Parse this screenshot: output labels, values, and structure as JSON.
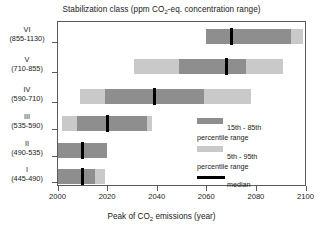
{
  "chart_data": {
    "type": "bar",
    "subtype": "horizontal-range-bar",
    "title": "Stabilization class (ppm CO2-eq. concentration range)",
    "title_parts": {
      "pre": "Stabilization class (ppm CO",
      "sub": "2",
      "post": "-eq. concentration range)"
    },
    "xlabel": "Peak of CO2 emissions (year)",
    "xlabel_parts": {
      "pre": "Peak of CO",
      "sub": "2",
      "post": " emissions (year)"
    },
    "ylabel": "",
    "xlim": [
      2000,
      2100
    ],
    "xticks": [
      2000,
      2020,
      2040,
      2060,
      2080,
      2100
    ],
    "xtick_labels": [
      "2000",
      "2020",
      "2040",
      "2060",
      "2080",
      "2100"
    ],
    "grid": false,
    "legend_position": "inside-right-middle",
    "categories": [
      "I",
      "II",
      "III",
      "IV",
      "V",
      "VI"
    ],
    "category_ranges": [
      "(445-490)",
      "(490-535)",
      "(535-590)",
      "(590-710)",
      "(710-855)",
      "(855-1130)"
    ],
    "series": [
      {
        "name": "5th - 95th percentile range",
        "color": "#c9c9c9",
        "values": [
          [
            2000,
            2019
          ],
          [
            2000,
            2020
          ],
          [
            2002,
            2038
          ],
          [
            2009,
            2078
          ],
          [
            2031,
            2091
          ],
          [
            2060,
            2099
          ]
        ]
      },
      {
        "name": "15th - 85th percentile range",
        "color": "#8e8e8e",
        "values": [
          [
            2000,
            2015
          ],
          [
            2000,
            2020
          ],
          [
            2008,
            2036
          ],
          [
            2019,
            2059
          ],
          [
            2049,
            2076
          ],
          [
            2060,
            2094
          ]
        ]
      },
      {
        "name": "median",
        "color": "#000000",
        "values": [
          2010,
          2010,
          2020,
          2039,
          2068,
          2070
        ]
      }
    ],
    "rows": [
      {
        "roman": "VI",
        "range": "(855-1130)",
        "p05": 2060,
        "p95": 2099,
        "p15": 2060,
        "p85": 2094,
        "median": 2070
      },
      {
        "roman": "V",
        "range": "(710-855)",
        "p05": 2031,
        "p95": 2091,
        "p15": 2049,
        "p85": 2076,
        "median": 2068
      },
      {
        "roman": "IV",
        "range": "(590-710)",
        "p05": 2009,
        "p95": 2078,
        "p15": 2019,
        "p85": 2059,
        "median": 2039
      },
      {
        "roman": "III",
        "range": "(535-590)",
        "p05": 2002,
        "p95": 2038,
        "p15": 2008,
        "p85": 2036,
        "median": 2020
      },
      {
        "roman": "II",
        "range": "(490-535)",
        "p05": 2000,
        "p95": 2020,
        "p15": 2000,
        "p85": 2020,
        "median": 2010
      },
      {
        "roman": "I",
        "range": "(445-490)",
        "p05": 2000,
        "p95": 2019,
        "p15": 2000,
        "p85": 2015,
        "median": 2010
      }
    ]
  },
  "legend": {
    "items": [
      {
        "label_line1": "15th - 85th",
        "label_line2": "percentile range",
        "swatch": "dark"
      },
      {
        "label_line1": "5th - 95th",
        "label_line2": "percentile range",
        "swatch": "light"
      },
      {
        "label_line1": "median",
        "label_line2": "",
        "swatch": "median"
      }
    ]
  },
  "colors": {
    "dark_band": "#8e8e8e",
    "light_band": "#c9c9c9",
    "median_line": "#000000",
    "axis": "#5a5a5a",
    "text": "#1a1a1a",
    "background": "#ffffff"
  }
}
